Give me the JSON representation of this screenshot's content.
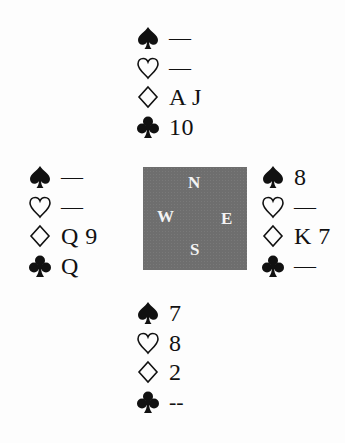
{
  "diagram": {
    "type": "bridge-deal",
    "suit_order": [
      "spades",
      "hearts",
      "diamonds",
      "clubs"
    ],
    "suit_icons": {
      "spades": "spade-icon (filled)",
      "hearts": "heart-icon (outline)",
      "diamonds": "diamond-icon (outline)",
      "clubs": "club-icon (filled)"
    },
    "compass": {
      "north": "N",
      "west": "W",
      "east": "E",
      "south": "S",
      "fill_color": "#6e6e6e",
      "text_color": "#f4f4f4"
    },
    "hands": {
      "north": {
        "spades": "—",
        "hearts": "—",
        "diamonds": "A J",
        "clubs": "10"
      },
      "west": {
        "spades": "—",
        "hearts": "—",
        "diamonds": "Q 9",
        "clubs": "Q"
      },
      "east": {
        "spades": "8",
        "hearts": "—",
        "diamonds": "K 7",
        "clubs": "—"
      },
      "south": {
        "spades": "7",
        "hearts": "8",
        "diamonds": "2",
        "clubs": "--"
      }
    }
  }
}
